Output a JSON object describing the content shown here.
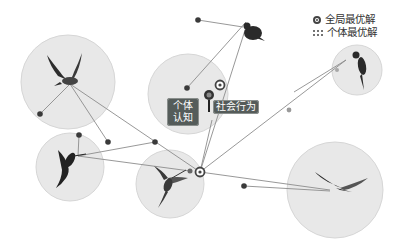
{
  "legend": {
    "global_best_label": "全局最优解",
    "individual_best_label": "个体最优解",
    "global_best_icon": "bullseye-icon",
    "individual_best_icon": "dot-grid-icon"
  },
  "labels": {
    "cognitive": "个体认知",
    "cognitive_line1": "个体",
    "cognitive_line2": "认知",
    "social": "社会行为"
  },
  "colors": {
    "circle_fill": "#e6e6e6",
    "circle_stroke": "#d2d2d2",
    "line": "#8c8c8c",
    "dot": "#3c3c3c",
    "tag_bg": "#555c5a"
  },
  "particles": [
    {
      "name": "bird-top-left",
      "type": "parrot-flying",
      "circle": {
        "cx": 68,
        "cy": 82,
        "r": 47
      }
    },
    {
      "name": "bird-mid-left",
      "type": "hummingbird",
      "circle": {
        "cx": 70,
        "cy": 167,
        "r": 34
      }
    },
    {
      "name": "bird-center-bottom",
      "type": "hummingbird",
      "circle": {
        "cx": 170,
        "cy": 184,
        "r": 34
      }
    },
    {
      "name": "bird-center-top",
      "type": "parrot-icon",
      "circle": {
        "cx": 188,
        "cy": 94,
        "r": 40
      }
    },
    {
      "name": "bird-top",
      "type": "finch",
      "circle": null
    },
    {
      "name": "bird-right-small",
      "type": "parrot-perched",
      "circle": {
        "cx": 357,
        "cy": 70,
        "r": 25
      }
    },
    {
      "name": "bird-right-large",
      "type": "swallow-gliding",
      "circle": {
        "cx": 335,
        "cy": 190,
        "r": 48
      }
    }
  ],
  "global_best": {
    "x": 200,
    "y": 172
  }
}
